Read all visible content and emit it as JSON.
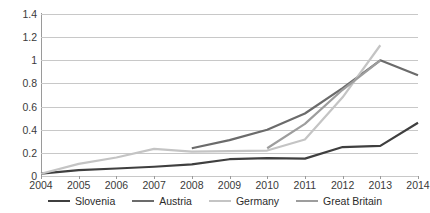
{
  "chart_data": {
    "type": "line",
    "title": "",
    "subtitle": "",
    "xlabel": "",
    "ylabel": "",
    "categories": [
      "2004",
      "2005",
      "2006",
      "2007",
      "2008",
      "2009",
      "2010",
      "2011",
      "2012",
      "2013",
      "2014"
    ],
    "ylim": [
      0,
      1.4
    ],
    "ytick_labels": [
      "0",
      "0.2",
      "0.4",
      "0.6",
      "0.8",
      "1",
      "1.2",
      "1.4"
    ],
    "ytick_values": [
      0,
      0.2,
      0.4,
      0.6,
      0.8,
      1.0,
      1.2,
      1.4
    ],
    "grid": "horizontal",
    "legend_position": "bottom",
    "series": [
      {
        "name": "Slovenia",
        "color": "#3f3f3f",
        "values": [
          0.02,
          0.05,
          0.065,
          0.08,
          0.1,
          0.145,
          0.155,
          0.15,
          0.25,
          0.26,
          0.46
        ]
      },
      {
        "name": "Austria",
        "color": "#6b6b6b",
        "values": [
          null,
          null,
          null,
          null,
          0.24,
          0.31,
          0.4,
          0.54,
          0.76,
          1.0,
          0.87
        ]
      },
      {
        "name": "Germany",
        "color": "#c4c4c4",
        "values": [
          0.02,
          0.105,
          0.16,
          0.235,
          0.21,
          0.215,
          0.22,
          0.315,
          0.68,
          1.13,
          null
        ]
      },
      {
        "name": "Great Britain",
        "color": "#9d9d9d",
        "values": [
          null,
          null,
          null,
          null,
          null,
          null,
          0.24,
          0.45,
          0.745,
          1.0,
          null
        ]
      }
    ]
  },
  "legend": {
    "items": [
      {
        "label": "Slovenia",
        "color": "#3f3f3f"
      },
      {
        "label": "Austria",
        "color": "#6b6b6b"
      },
      {
        "label": "Germany",
        "color": "#c4c4c4"
      },
      {
        "label": "Great Britain",
        "color": "#9d9d9d"
      }
    ]
  },
  "colors": {
    "background": "#ffffff",
    "gridline": "#c8c8c8",
    "axis": "#9a9a9a",
    "text": "#2b2b2b"
  }
}
